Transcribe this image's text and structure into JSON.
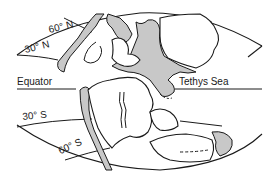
{
  "map": {
    "type": "paleogeographic reconstruction",
    "projection": "elliptical world outline",
    "colors": {
      "line": "#1a1a1a",
      "land": "#ffffff",
      "sea_shaded": "#c8c8c8",
      "background": "#ffffff"
    },
    "latitude_labels": {
      "n60": "60° N",
      "n30": "30° N",
      "equator": "Equator",
      "s30": "30° S",
      "s60": "60° S"
    },
    "feature_labels": {
      "tethys": "Tethys Sea"
    }
  }
}
